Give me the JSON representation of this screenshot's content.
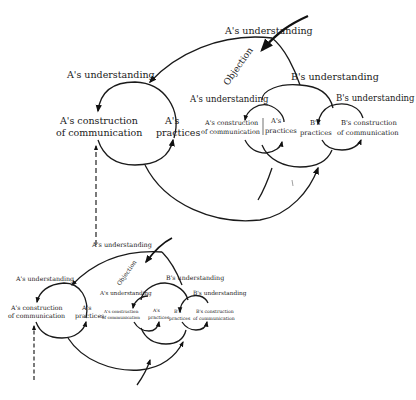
{
  "figures": [
    {
      "id": "large",
      "labels": {
        "top_a_understanding": "A's understanding",
        "left_a_understanding": "A's understanding",
        "a_construction_line1": "A's construction",
        "a_construction_line2": "of communication",
        "a_practices_line1": "A's",
        "a_practices_line2": "practices",
        "objection": "Objection",
        "b_understanding_mid": "B's understanding",
        "inner_a_understanding": "A's understanding",
        "inner_a_construction_line1": "A's construction",
        "inner_a_construction_line2": "of communication",
        "inner_a_practices_line1": "A's",
        "inner_a_practices_line2": "practices",
        "b_practices_line1": "B's",
        "b_practices_line2": "practices",
        "b_understanding_right": "B's understanding",
        "b_construction_line1": "B's construction",
        "b_construction_line2": "of communication"
      }
    },
    {
      "id": "small",
      "labels": {
        "top_a_understanding": "A's understanding",
        "left_a_understanding": "A's understanding",
        "a_construction_line1": "A's construction",
        "a_construction_line2": "of communication",
        "a_practices_line1": "A's",
        "a_practices_line2": "practices",
        "objection": "Objection",
        "b_understanding_mid": "B's understanding",
        "inner_a_understanding": "A's understanding",
        "inner_a_construction_line1": "A's construction",
        "inner_a_construction_line2": "of communication",
        "inner_a_practices_line1": "A's",
        "inner_a_practices_line2": "practices",
        "b_practices_line1": "B's",
        "b_practices_line2": "practices",
        "b_understanding_right": "B's understanding",
        "b_construction_line1": "B's construction",
        "b_construction_line2": "of communication"
      }
    }
  ],
  "colors": {
    "ink": "#1a1a1a",
    "background": "#ffffff"
  }
}
